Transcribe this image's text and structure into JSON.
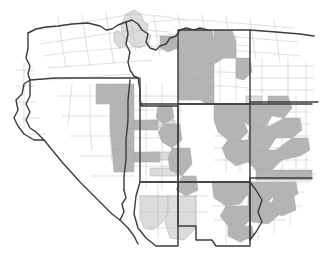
{
  "figure": {
    "kind": "choropleth-map",
    "title": "",
    "subtitle": "",
    "legend": "",
    "annotations": [],
    "background_color": "#ffffff",
    "width_px": 320,
    "height_px": 269
  },
  "styles": {
    "state_border_color": "#3c3c3c",
    "state_border_width_px": 1.4,
    "county_border_color": "#ababab",
    "county_border_width_px": 0.5,
    "shade_none": "#ffffff",
    "shade_light": "#dcdcdc",
    "shade_mid": "#b4b4b4"
  },
  "map_data": {
    "type": "choropleth",
    "region": "Western United States",
    "unit_level": "county",
    "shade_classes": [
      {
        "key": "none",
        "color": "#ffffff",
        "label": ""
      },
      {
        "key": "light",
        "color": "#dcdcdc",
        "label": ""
      },
      {
        "key": "mid",
        "color": "#b4b4b4",
        "label": ""
      }
    ],
    "states": [
      {
        "code": "CA",
        "name": "California",
        "shade": "none",
        "position": "far-left-edge"
      },
      {
        "code": "OR",
        "name": "Oregon",
        "shade": "none",
        "position": "top-left"
      },
      {
        "code": "NV",
        "name": "Nevada",
        "shade": "none",
        "position": "left-center"
      },
      {
        "code": "ID",
        "name": "Idaho",
        "shade": "light",
        "position": "top-center-left"
      },
      {
        "code": "MT",
        "name": "Montana",
        "shade": "light",
        "position": "top-center"
      },
      {
        "code": "WY",
        "name": "Wyoming",
        "shade": "mid",
        "position": "top-right"
      },
      {
        "code": "UT",
        "name": "Utah",
        "shade": "mid",
        "position": "center"
      },
      {
        "code": "CO",
        "name": "Colorado",
        "shade": "mid",
        "position": "center-right"
      },
      {
        "code": "AZ",
        "name": "Arizona",
        "shade": "light",
        "position": "bottom-center-left"
      },
      {
        "code": "NM",
        "name": "New Mexico",
        "shade": "mid",
        "position": "bottom-right"
      },
      {
        "code": "NE",
        "name": "Nebraska",
        "shade": "mid",
        "position": "right-edge-upper"
      },
      {
        "code": "KS",
        "name": "Kansas",
        "shade": "mid",
        "position": "right-edge-center"
      },
      {
        "code": "OK",
        "name": "Oklahoma",
        "shade": "mid",
        "position": "right-edge-lower"
      },
      {
        "code": "TX",
        "name": "Texas",
        "shade": "none",
        "position": "bottom-right-corner"
      }
    ]
  }
}
